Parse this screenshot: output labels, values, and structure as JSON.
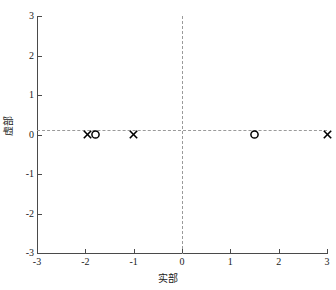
{
  "chart_data": {
    "type": "scatter",
    "title": "",
    "xlabel": "实部",
    "ylabel": "虚部",
    "xlim": [
      -3,
      3
    ],
    "ylim": [
      -3,
      3
    ],
    "xticks": [
      -3,
      -2,
      -1,
      0,
      1,
      2,
      3
    ],
    "yticks": [
      -3,
      -2,
      -1,
      0,
      1,
      2,
      3
    ],
    "xticklabels": [
      "-3",
      "-2",
      "-1",
      "0",
      "1",
      "2",
      "3"
    ],
    "yticklabels": [
      "-3",
      "-2",
      "-1",
      "0",
      "1",
      "2",
      "3"
    ],
    "grid": false,
    "legend": null,
    "annotations": [
      {
        "kind": "axis-line",
        "orientation": "horizontal",
        "value": 0,
        "style": "dashed",
        "color": "#9a9a9a"
      },
      {
        "kind": "axis-line",
        "orientation": "vertical",
        "value": 0,
        "style": "dashed",
        "color": "#9a9a9a"
      }
    ],
    "series": [
      {
        "name": "极点",
        "marker": "x",
        "color": "#000000",
        "points": [
          {
            "x": -1.95,
            "y": 0
          },
          {
            "x": -1.0,
            "y": 0
          },
          {
            "x": 3.0,
            "y": 0
          }
        ]
      },
      {
        "name": "零点",
        "marker": "o",
        "color": "#000000",
        "points": [
          {
            "x": -1.8,
            "y": 0
          },
          {
            "x": 1.5,
            "y": 0
          }
        ]
      }
    ]
  },
  "colors": {
    "axis": "#4a4a4a",
    "grid_dashed": "#9a9a9a",
    "marker": "#000000",
    "background": "#ffffff",
    "text": "#1a1a1a"
  }
}
